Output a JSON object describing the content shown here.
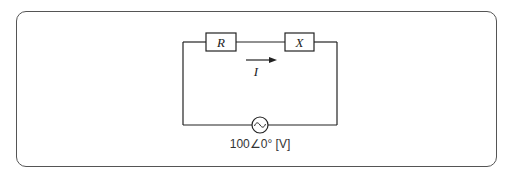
{
  "diagram": {
    "type": "series AC circuit",
    "components": [
      {
        "id": "resistor",
        "label": "R"
      },
      {
        "id": "reactance",
        "label": "X"
      }
    ],
    "current": {
      "label": "I",
      "direction": "left-to-right"
    },
    "source": {
      "type": "AC voltage source",
      "symbol": "sine-wave",
      "label": "100∠0° [V]"
    }
  },
  "colors": {
    "line": "#222222",
    "frame": "#555555",
    "background": "#ffffff"
  }
}
